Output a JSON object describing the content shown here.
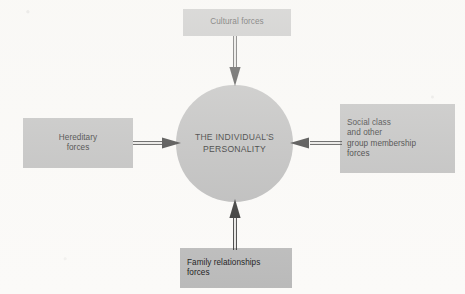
{
  "diagram": {
    "title_text": "Forces shaping the individual's personality",
    "background_color": "#fbfaf8",
    "node_fill_color": "#b9b9b9",
    "hub_fill_color": "#b7b7b7",
    "line_color": "#2b2b2b",
    "center": {
      "name": "individuals-personality",
      "label": "THE INDIVIDUAL'S\nPERSONALITY",
      "shape": "circle"
    },
    "nodes": [
      {
        "name": "cultural-forces",
        "label": "Cultural forces",
        "position": "top",
        "align": "center"
      },
      {
        "name": "hereditary-forces",
        "label": "Hereditary\nforces",
        "position": "left",
        "align": "center"
      },
      {
        "name": "social-class-and-other-group-membership-forces",
        "label": "Social class\nand other\ngroup membership\nforces",
        "position": "right",
        "align": "left"
      },
      {
        "name": "family-relationships-forces",
        "label": "Family relationships\nforces",
        "position": "bottom",
        "align": "left"
      }
    ],
    "arrows": [
      {
        "name": "arrow-cultural-to-center",
        "from": "cultural-forces",
        "to": "individuals-personality",
        "direction": "down"
      },
      {
        "name": "arrow-hereditary-to-center",
        "from": "hereditary-forces",
        "to": "individuals-personality",
        "direction": "right"
      },
      {
        "name": "arrow-social-class-to-center",
        "from": "social-class-and-other-group-membership-forces",
        "to": "individuals-personality",
        "direction": "left"
      },
      {
        "name": "arrow-family-to-center",
        "from": "family-relationships-forces",
        "to": "individuals-personality",
        "direction": "up"
      }
    ]
  }
}
